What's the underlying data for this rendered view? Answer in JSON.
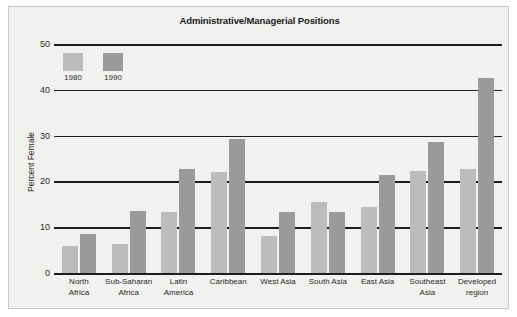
{
  "chart_data": {
    "type": "bar",
    "title": "Administrative/Managerial Positions",
    "xlabel": "",
    "ylabel": "Percent Female",
    "ylim": [
      0,
      50
    ],
    "yticks": [
      0,
      10,
      20,
      30,
      40,
      50
    ],
    "ytick_labels": [
      "0",
      "10",
      "20",
      "30",
      "40",
      "50"
    ],
    "grid": true,
    "legend_position": "top-left inside plot",
    "categories": [
      "North Africa",
      "Sub-Saharan Africa",
      "Latin America",
      "Caribbean",
      "West Asia",
      "South Asia",
      "East Asia",
      "Southeast Asia",
      "Developed region"
    ],
    "category_lines": [
      [
        "North",
        "Africa"
      ],
      [
        "Sub-Saharan",
        "Africa"
      ],
      [
        "Latin",
        "America"
      ],
      [
        "Caribbean"
      ],
      [
        "West Asia"
      ],
      [
        "South Asia"
      ],
      [
        "East Asia"
      ],
      [
        "Southeast",
        "Asia"
      ],
      [
        "Developed",
        "region"
      ]
    ],
    "series": [
      {
        "name": "1980",
        "color": "#bcbcba",
        "values": [
          6.0,
          6.3,
          13.3,
          22.0,
          8.0,
          15.4,
          14.5,
          22.2,
          22.8
        ]
      },
      {
        "name": "1990",
        "color": "#9a9a98",
        "values": [
          8.5,
          13.5,
          22.8,
          29.3,
          13.3,
          13.3,
          21.3,
          28.5,
          42.5
        ]
      }
    ]
  },
  "legend": {
    "items": [
      {
        "label": "1980",
        "color": "#bcbcba"
      },
      {
        "label": "1990",
        "color": "#9a9a98"
      }
    ]
  },
  "colors": {
    "bar_1980": "#bcbcba",
    "bar_1990": "#9a9a98",
    "gridline": "#1e1e1e",
    "panel_background": "#f1f1ef",
    "page_background": "#ffffff",
    "text": "#2a2a2a"
  }
}
